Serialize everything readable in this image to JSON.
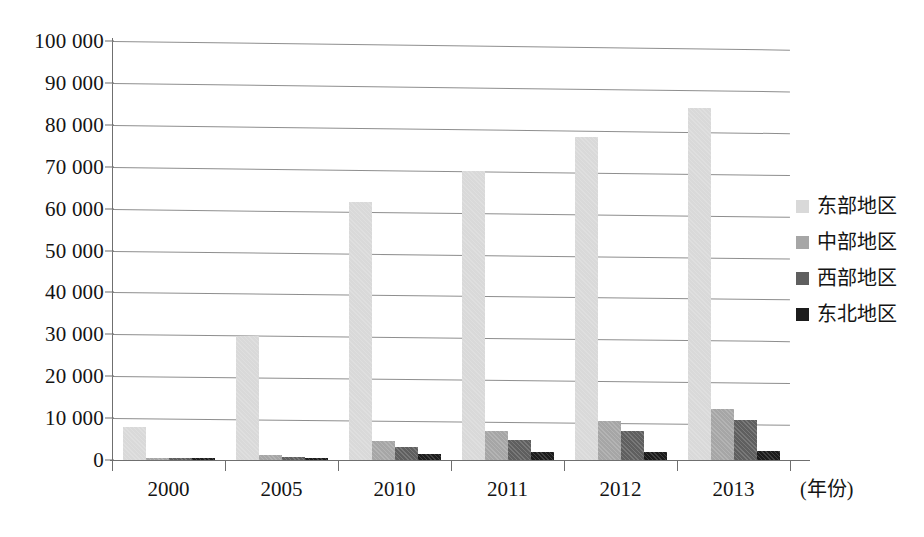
{
  "chart_data": {
    "type": "bar",
    "title": "",
    "subtitle": "",
    "xlabel": "(年份)",
    "ylabel": "",
    "categories": [
      "2000",
      "2005",
      "2010",
      "2011",
      "2012",
      "2013"
    ],
    "ylim": [
      0,
      100000
    ],
    "ytick_values": [
      0,
      10000,
      20000,
      30000,
      40000,
      50000,
      60000,
      70000,
      80000,
      90000,
      100000
    ],
    "ytick_labels": [
      "0",
      "10 000",
      "20 000",
      "30 000",
      "40 000",
      "50 000",
      "60 000",
      "70 000",
      "80 000",
      "90 000",
      "100 000"
    ],
    "grid": true,
    "legend_position": "right",
    "series": [
      {
        "name": "东部地区",
        "color": "#d9d9d9",
        "values": [
          7900,
          29500,
          61500,
          69000,
          77000,
          84000
        ]
      },
      {
        "name": "中部地区",
        "color": "#a6a6a6",
        "values": [
          450,
          1100,
          4500,
          6900,
          9400,
          12100
        ]
      },
      {
        "name": "西部地区",
        "color": "#5f5f5f",
        "values": [
          350,
          700,
          3000,
          4700,
          7000,
          9500
        ]
      },
      {
        "name": "东北地区",
        "color": "#1c1c1c",
        "values": [
          250,
          600,
          1500,
          1800,
          2000,
          2200
        ]
      }
    ]
  },
  "legend": {
    "items": [
      {
        "label": "东部地区",
        "color": "#d9d9d9"
      },
      {
        "label": "中部地区",
        "color": "#a6a6a6"
      },
      {
        "label": "西部地区",
        "color": "#5f5f5f"
      },
      {
        "label": "东北地区",
        "color": "#1c1c1c"
      }
    ]
  },
  "axis": {
    "x_caption": "(年份)"
  }
}
